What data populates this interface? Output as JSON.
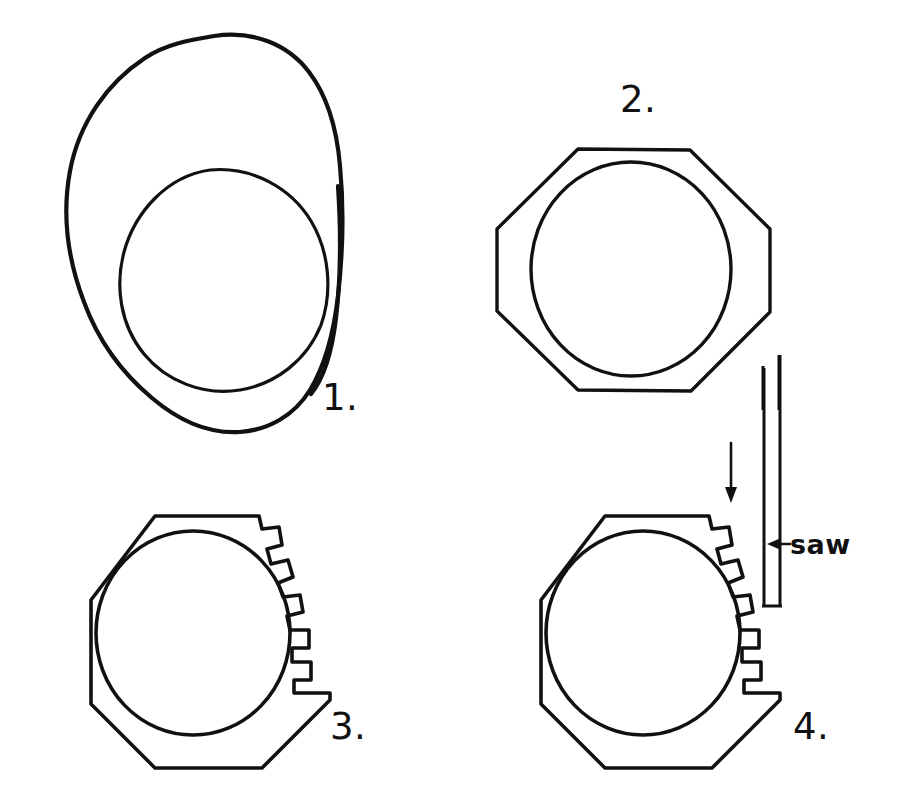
{
  "figure": {
    "background_color": "#ffffff",
    "ink_color": "#111111",
    "width": 897,
    "height": 796
  },
  "panels": [
    {
      "id": "panel-1",
      "number_label": "1.",
      "number_x": 322,
      "number_y": 410,
      "description": "irregular rounded blank with an offset circular hole"
    },
    {
      "id": "panel-2",
      "number_label": "2.",
      "number_x": 620,
      "number_y": 112,
      "description": "blank trimmed to an octagon around the circular hole"
    },
    {
      "id": "panel-3",
      "number_label": "3.",
      "number_x": 330,
      "number_y": 739,
      "description": "octagon with seven square notches cut into the upper-right and right rim"
    },
    {
      "id": "panel-4",
      "number_label": "4.",
      "number_x": 793,
      "number_y": 739,
      "description": "same toothed octagon with a saw blade descending to cut the next notch"
    }
  ],
  "annotations": [
    {
      "id": "saw-label",
      "text": "saw",
      "marker": "←",
      "x": 784,
      "y": 551,
      "points_to": "saw-blade"
    },
    {
      "id": "feed-arrow",
      "direction": "down",
      "meaning": "saw feed direction",
      "x": 731,
      "y": 455
    }
  ],
  "geometry": {
    "blob_outer_path": "M 212,36 C 258,32 300,56 318,96 C 334,130 340,172 341,214 C 342,258 340,300 331,336 C 322,372 300,398 266,414 C 232,430 196,424 166,404 C 130,380 102,344 84,302 C 66,258 62,212 70,170 C 80,124 108,82 146,58 C 166,44 190,38 212,36 Z",
    "blob_inner_path": "M 208,170 C 250,168 288,190 308,222 C 326,252 330,292 318,324 C 304,358 274,382 238,388 C 202,394 166,380 144,354 C 120,326 114,288 122,254 C 132,214 164,180 208,170 Z",
    "octagon2_outer_points": "577,149 689,149 770,228 770,311 690,390 577,390 497,311 497,229",
    "octagon2_inner_ellipse": {
      "cx": 630,
      "cy": 268,
      "rx": 100,
      "ry": 106
    },
    "octagon3_outer_points": "154,516 262,516 277,532 277,700 215,768 110,768 89,685 89,600",
    "octagon3_inner_ellipse": {
      "cx": 193,
      "cy": 633,
      "rx": 97,
      "ry": 102
    },
    "octagon4_outer_points": "604,516 712,516 727,532 727,700 665,768 560,768 539,685 539,600",
    "octagon4_inner_ellipse": {
      "cx": 643,
      "cy": 633,
      "rx": 97,
      "ry": 102
    },
    "tooth_count": 7,
    "saw_blade": {
      "x_left": 763,
      "x_right": 779,
      "y_top": 355,
      "y_bottom": 608
    }
  }
}
